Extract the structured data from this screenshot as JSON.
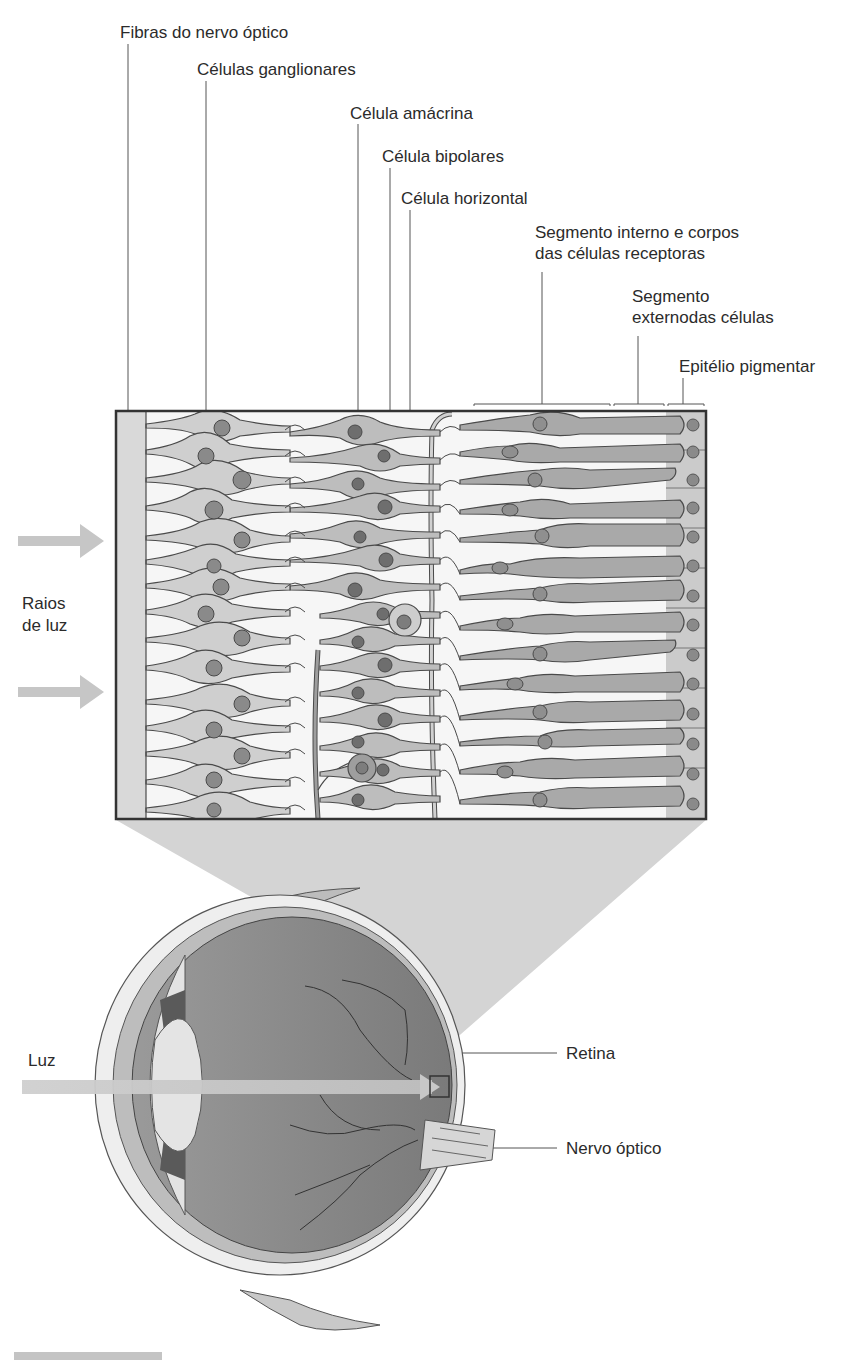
{
  "diagram": {
    "type": "anatomy",
    "colors": {
      "background": "#ffffff",
      "cell_fill": "#c9c9c9",
      "receptor_fill": "#a8a8a8",
      "nucleus_fill": "#7d7d7d",
      "outline": "#4a4a4a",
      "light_arrow": "#c4c4c4",
      "projection_fill": "#d2d2d2",
      "eye_interior": "#8c8c8c"
    }
  },
  "labels": {
    "optic_nerve_fibers": "Fibras do nervo óptico",
    "ganglion_cells": "Células ganglionares",
    "amacrine_cell": "Célula amácrina",
    "bipolar_cells": "Célula bipolares",
    "horizontal_cell": "Célula horizontal",
    "inner_segment_line1": "Segmento interno e corpos",
    "inner_segment_line2": "das células receptoras",
    "outer_segment_line1": "Segmento",
    "outer_segment_line2": "externodas células",
    "pigment_epithelium": "Epitélio pigmentar",
    "light_rays_line1": "Raios",
    "light_rays_line2": "de luz",
    "light": "Luz",
    "retina": "Retina",
    "optic_nerve": "Nervo óptico"
  }
}
